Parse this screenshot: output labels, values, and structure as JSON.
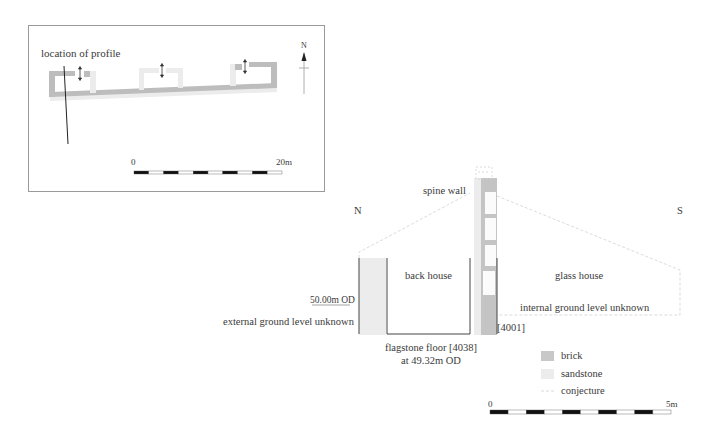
{
  "plan": {
    "location_label": "location of profile",
    "north_label": "N",
    "scale": {
      "start": "0",
      "end": "20m",
      "segments": 10
    }
  },
  "section": {
    "orientation_left": "N",
    "orientation_right": "S",
    "spine_wall_label": "spine wall",
    "back_house_label": "back house",
    "glass_house_label": "glass house",
    "od_level_label": "50.00m OD",
    "external_ground_label": "external ground level unknown",
    "internal_ground_label": "internal ground level unknown",
    "wall_context_label": "[4001]",
    "floor_label_line1": "flagstone floor [4038]",
    "floor_label_line2": "at 49.32m OD"
  },
  "legend": {
    "items": [
      {
        "label": "brick",
        "color": "#c8c8c8",
        "style": "fill"
      },
      {
        "label": "sandstone",
        "color": "#ececec",
        "style": "fill"
      },
      {
        "label": "conjecture",
        "color": "#d0d0d0",
        "style": "dashed"
      }
    ]
  },
  "scale": {
    "start": "0",
    "end": "5m",
    "segments": 10
  },
  "colors": {
    "brick": "#bdbdbd",
    "sandstone": "#e9e9e9",
    "line": "#444444",
    "conjecture": "#d2d2d2"
  }
}
